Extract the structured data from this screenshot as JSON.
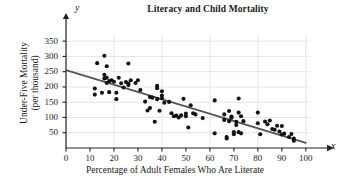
{
  "chart_data": {
    "type": "scatter",
    "title": "Literacy and Child Mortality",
    "xlabel": "Percentage of Adult Females Who Are Literate",
    "ylabel": "Under-Five Mortality\n(per thousand)",
    "ylabel_line1": "Under-Five Mortality",
    "ylabel_line2": "(per thousand)",
    "x_axis_symbol": "x",
    "y_axis_symbol": "y",
    "xlim": [
      0,
      103
    ],
    "ylim": [
      0,
      380
    ],
    "xticks": [
      0,
      10,
      20,
      30,
      40,
      50,
      60,
      70,
      80,
      90,
      100
    ],
    "yticks": [
      50,
      100,
      150,
      200,
      250,
      300,
      350
    ],
    "grid": true,
    "grid_x": [
      20,
      40,
      60,
      80,
      100
    ],
    "grid_y": [
      50,
      100,
      150,
      200,
      250,
      300,
      350
    ],
    "legend": null,
    "marker_color": "#111111",
    "trendline_color": "#555555",
    "grid_color": "#e4e4e4",
    "axis_color": "#222222",
    "trendline": {
      "x_start": 0,
      "y_start": 255,
      "x_end": 100,
      "y_end": 17
    },
    "points": [
      [
        12,
        175
      ],
      [
        12,
        195
      ],
      [
        13,
        278
      ],
      [
        15,
        181
      ],
      [
        16,
        302
      ],
      [
        16,
        240
      ],
      [
        16,
        228
      ],
      [
        17,
        230
      ],
      [
        17,
        268
      ],
      [
        17,
        213
      ],
      [
        18,
        219
      ],
      [
        18,
        183
      ],
      [
        19,
        222
      ],
      [
        20,
        217
      ],
      [
        21,
        181
      ],
      [
        21,
        160
      ],
      [
        22,
        230
      ],
      [
        23,
        212
      ],
      [
        24,
        198
      ],
      [
        25,
        216
      ],
      [
        26,
        277
      ],
      [
        26,
        211
      ],
      [
        26,
        206
      ],
      [
        27,
        222
      ],
      [
        29,
        213
      ],
      [
        30,
        222
      ],
      [
        31,
        190
      ],
      [
        33,
        152
      ],
      [
        34,
        123
      ],
      [
        35,
        131
      ],
      [
        35,
        167
      ],
      [
        36,
        165
      ],
      [
        37,
        86
      ],
      [
        38,
        204
      ],
      [
        38,
        196
      ],
      [
        38,
        160
      ],
      [
        39,
        122
      ],
      [
        40,
        186
      ],
      [
        40,
        172
      ],
      [
        40,
        163
      ],
      [
        41,
        148
      ],
      [
        43,
        151
      ],
      [
        44,
        114
      ],
      [
        45,
        104
      ],
      [
        46,
        106
      ],
      [
        47,
        100
      ],
      [
        48,
        107
      ],
      [
        49,
        161
      ],
      [
        50,
        113
      ],
      [
        50,
        104
      ],
      [
        51,
        67
      ],
      [
        52,
        140
      ],
      [
        53,
        114
      ],
      [
        54,
        110
      ],
      [
        57,
        98
      ],
      [
        62,
        156
      ],
      [
        62,
        48
      ],
      [
        66,
        92
      ],
      [
        66,
        110
      ],
      [
        67,
        31
      ],
      [
        67,
        36
      ],
      [
        68,
        121
      ],
      [
        68,
        88
      ],
      [
        69,
        103
      ],
      [
        69,
        99
      ],
      [
        70,
        45
      ],
      [
        70,
        52
      ],
      [
        71,
        86
      ],
      [
        71,
        75
      ],
      [
        72,
        162
      ],
      [
        72,
        116
      ],
      [
        72,
        52
      ],
      [
        73,
        104
      ],
      [
        73,
        48
      ],
      [
        74,
        88
      ],
      [
        80,
        116
      ],
      [
        80,
        81
      ],
      [
        81,
        45
      ],
      [
        83,
        87
      ],
      [
        84,
        78
      ],
      [
        85,
        90
      ],
      [
        86,
        62
      ],
      [
        87,
        60
      ],
      [
        88,
        73
      ],
      [
        89,
        54
      ],
      [
        90,
        72
      ],
      [
        90,
        44
      ],
      [
        91,
        47
      ],
      [
        93,
        36
      ],
      [
        94,
        46
      ],
      [
        95,
        24
      ],
      [
        95,
        31
      ]
    ]
  }
}
